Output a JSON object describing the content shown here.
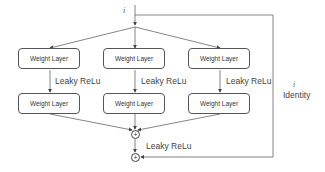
{
  "diagram": {
    "input_symbol": "i",
    "branches": [
      {
        "layer1": "Weight Layer",
        "activation": "Leaky ReLu",
        "layer2": "Weight Layer"
      },
      {
        "layer1": "Weight Layer",
        "activation": "Leaky ReLu",
        "layer2": "Weight Layer"
      },
      {
        "layer1": "Weight Layer",
        "activation": "Leaky ReLu",
        "layer2": "Weight Layer"
      }
    ],
    "sum_symbol": "+",
    "post_sum_activation": "Leaky ReLu",
    "skip": {
      "symbol": "i",
      "label": "Identity"
    },
    "colors": {
      "line": "#555555",
      "text": "#444444",
      "background": "#ffffff"
    }
  }
}
